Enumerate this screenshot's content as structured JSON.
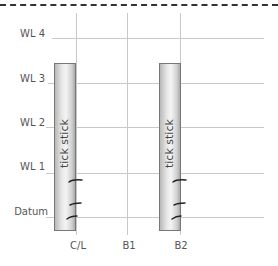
{
  "diagram": {
    "water_lines": [
      {
        "label": "WL 4",
        "y": 38
      },
      {
        "label": "WL 3",
        "y": 83
      },
      {
        "label": "WL 2",
        "y": 127
      },
      {
        "label": "WL 1",
        "y": 173
      },
      {
        "label": "Datum",
        "y": 217
      }
    ],
    "columns": [
      {
        "label": "C/L",
        "x": 76
      },
      {
        "label": "B1",
        "x": 127
      },
      {
        "label": "B2",
        "x": 180
      }
    ],
    "sticks": [
      {
        "label": "tick stick",
        "x": 54,
        "width": 21,
        "top": 63,
        "bottom": 229
      },
      {
        "label": "tick stick",
        "x": 159,
        "width": 21,
        "top": 63,
        "bottom": 229
      }
    ],
    "colors": {
      "grid": "#c8c8c8",
      "dash": "#333333",
      "stick_border": "#777777",
      "tick_mark": "#222222"
    }
  }
}
